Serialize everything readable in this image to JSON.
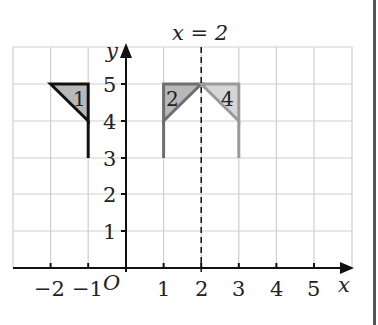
{
  "diagram": {
    "title_label": "x = 2",
    "axes": {
      "x_label": "x",
      "y_label": "y",
      "origin_label": "O",
      "x_ticks": [
        {
          "value": -2,
          "label": "−2"
        },
        {
          "value": -1,
          "label": "−1"
        },
        {
          "value": 1,
          "label": "1"
        },
        {
          "value": 2,
          "label": "2"
        },
        {
          "value": 3,
          "label": "3"
        },
        {
          "value": 4,
          "label": "4"
        },
        {
          "value": 5,
          "label": "5"
        }
      ],
      "y_ticks": [
        {
          "value": 1,
          "label": "1"
        },
        {
          "value": 2,
          "label": "2"
        },
        {
          "value": 3,
          "label": "3"
        },
        {
          "value": 4,
          "label": "4"
        },
        {
          "value": 5,
          "label": "5"
        }
      ],
      "x_range": [
        -3,
        6
      ],
      "y_range": [
        0,
        6
      ]
    },
    "mirror_line": {
      "x": 2,
      "style": "dashed"
    },
    "shapes": [
      {
        "label": "1",
        "triangle": [
          [
            -2,
            5
          ],
          [
            -1,
            5
          ],
          [
            -1,
            4
          ]
        ],
        "stem": [
          [
            -1,
            4
          ],
          [
            -1,
            3
          ]
        ],
        "stroke": "#111111",
        "fill": "#b8b8b8"
      },
      {
        "label": "2",
        "triangle": [
          [
            1,
            5
          ],
          [
            2,
            5
          ],
          [
            1,
            4
          ]
        ],
        "stem": [
          [
            1,
            4
          ],
          [
            1,
            3
          ]
        ],
        "stroke": "#6e6e6e",
        "fill": "#b8b8b8"
      },
      {
        "label": "4",
        "triangle": [
          [
            2,
            5
          ],
          [
            3,
            5
          ],
          [
            3,
            4
          ]
        ],
        "stem": [
          [
            3,
            4
          ],
          [
            3,
            3
          ]
        ],
        "stroke": "#9a9a9a",
        "fill": "#d6d6d6"
      }
    ],
    "colors": {
      "grid": "#cfcfcf",
      "axis": "#111111",
      "page_border": "#555555"
    }
  }
}
